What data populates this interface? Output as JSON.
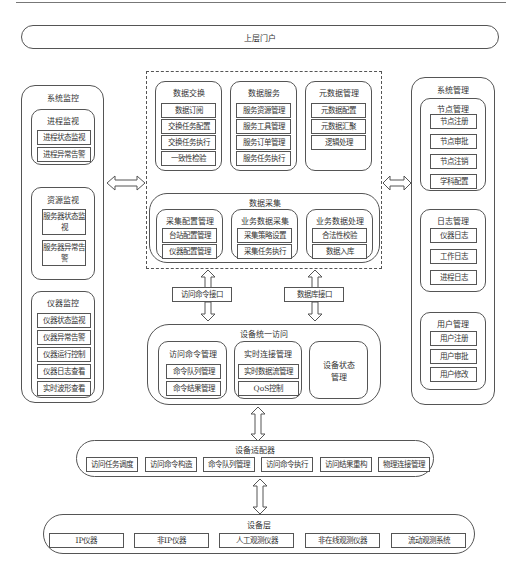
{
  "portal": {
    "label": "上层门户"
  },
  "system_monitor": {
    "title": "系统监控",
    "groups": [
      {
        "title": "进程监视",
        "items": [
          "进程状态监视",
          "进程异常告警"
        ]
      },
      {
        "title": "资源监视",
        "items": [
          "服务器状态监视",
          "服务器异常告警"
        ]
      },
      {
        "title": "仪器监控",
        "items": [
          "仪器状态监视",
          "仪器异常告警",
          "仪器运行控制",
          "仪器日志查看",
          "实时波形查看"
        ]
      }
    ]
  },
  "center": {
    "data_exchange": {
      "title": "数据交换",
      "items": [
        "数据订阅",
        "交换任务配置",
        "交换任务执行",
        "一致性检验"
      ]
    },
    "data_service": {
      "title": "数据服务",
      "items": [
        "服务资源管理",
        "服务工具管理",
        "服务订单管理",
        "服务任务执行"
      ]
    },
    "metadata": {
      "title": "元数据管理",
      "items": [
        "元数据配置",
        "元数据汇聚",
        "逻辑处理"
      ]
    },
    "data_collection": {
      "title": "数据采集",
      "groups": [
        {
          "title": "采集配置管理",
          "items": [
            "台站配置管理",
            "仪器配置管理"
          ]
        },
        {
          "title": "业务数据采集",
          "items": [
            "采集策略设置",
            "采集任务执行"
          ]
        },
        {
          "title": "业务数据处理",
          "items": [
            "合法性校验",
            "数据入库"
          ]
        }
      ]
    }
  },
  "interfaces": {
    "command": "访问命令接口",
    "database": "数据库接口"
  },
  "device_access": {
    "title": "设备统一访问",
    "command_mgmt": {
      "title": "访问命令管理",
      "items": [
        "命令队列管理",
        "命令结果管理"
      ]
    },
    "realtime_mgmt": {
      "title": "实时连接管理",
      "items": [
        "实时数据流管理",
        "QoS控制"
      ]
    },
    "status_mgmt": {
      "title": "设备状态管理"
    }
  },
  "system_mgmt": {
    "title": "系统管理",
    "groups": [
      {
        "title": "节点管理",
        "items": [
          "节点注册",
          "节点审批",
          "节点注销",
          "学科配置"
        ]
      },
      {
        "title": "日志管理",
        "items": [
          "仪器日志",
          "工作日志",
          "进程日志"
        ]
      },
      {
        "title": "用户管理",
        "items": [
          "用户注册",
          "用户审批",
          "用户修改"
        ]
      }
    ]
  },
  "adapter": {
    "title": "设备适配器",
    "items": [
      "访问任务调度",
      "访问命令构造",
      "命令队列管理",
      "访问命令执行",
      "访问结果重构",
      "物理连接管理"
    ]
  },
  "device_layer": {
    "title": "设备层",
    "items": [
      "IP仪器",
      "非IP仪器",
      "人工观测仪器",
      "非在线观测仪器",
      "流动观测系统"
    ]
  }
}
